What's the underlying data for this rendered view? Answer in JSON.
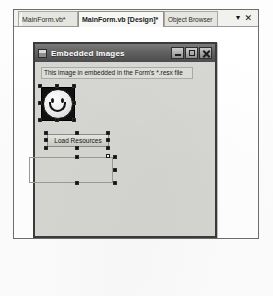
{
  "ide": {
    "tabs": [
      {
        "label": "MainForm.vb*",
        "active": false,
        "name": "tab-mainform-vb"
      },
      {
        "label": "MainForm.vb [Design]*",
        "active": true,
        "name": "tab-mainform-design"
      },
      {
        "label": "Object Browser",
        "active": false,
        "name": "tab-object-browser"
      }
    ],
    "tab_controls": {
      "dropdown_icon": "chevron-down-icon",
      "dropdown_glyph": "▾",
      "close_icon": "close-icon",
      "close_glyph": "✕"
    }
  },
  "form": {
    "title": "Embedded Images",
    "icon": "form-icon",
    "window_buttons": [
      {
        "name": "minimize-button",
        "label": "Minimize"
      },
      {
        "name": "maximize-button",
        "label": "Maximize"
      },
      {
        "name": "close-button",
        "label": "Close"
      }
    ],
    "controls": {
      "label": {
        "text": "This image in embedded in the Form's *.resx file",
        "name": "info-label"
      },
      "picture_box": {
        "name": "picture-box-smiley",
        "image": "smiley-face-icon",
        "selected": true
      },
      "button": {
        "text": "Load Resources",
        "name": "load-resources-button",
        "selected": true
      },
      "empty_picture_box": {
        "name": "empty-picture-box",
        "text": "",
        "selected": true
      }
    }
  },
  "colors": {
    "titlebar": "#616161",
    "form_face": "#d6d6d2",
    "selection_handle": "#101010",
    "tab_active": "#f7f7f5",
    "tab_inactive": "#e9e9e4"
  }
}
